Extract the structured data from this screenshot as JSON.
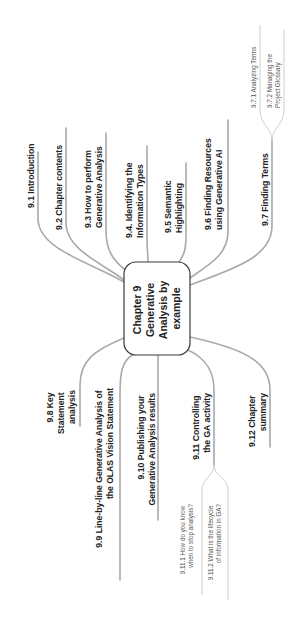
{
  "diagram": {
    "type": "mind-map",
    "orientation": "rotated-90-ccw",
    "central_topic": {
      "lines": [
        "Chapter 9",
        "Generative",
        "Analysis by",
        "example"
      ]
    },
    "right_branches": [
      {
        "id": "9.1",
        "lines": [
          "9.1 Introduction"
        ]
      },
      {
        "id": "9.2",
        "lines": [
          "9.2 Chapter contents"
        ]
      },
      {
        "id": "9.3",
        "lines": [
          "9.3 How to perform",
          "Generative Analysis"
        ]
      },
      {
        "id": "9.4",
        "lines": [
          "9.4. Identifying the",
          "Information Types"
        ]
      },
      {
        "id": "9.5",
        "lines": [
          "9.5 Semantic",
          "Highlighting"
        ]
      },
      {
        "id": "9.6",
        "lines": [
          "9.6 Finding Resources",
          "using Generative AI"
        ]
      },
      {
        "id": "9.7",
        "lines": [
          "9.7 Finding Terms"
        ],
        "children": [
          {
            "id": "9.7.1",
            "lines": [
              "9.7.1 Analyzing Terms"
            ]
          },
          {
            "id": "9.7.2",
            "lines": [
              "9.7.2 Managing the",
              "Project Glossary"
            ]
          }
        ]
      }
    ],
    "left_branches": [
      {
        "id": "9.8",
        "lines": [
          "9.8 Key",
          "Statement",
          "analysis"
        ]
      },
      {
        "id": "9.9",
        "lines": [
          "9.9 Line-by-line Generative Analysis of",
          "the OLAS Vision Statement"
        ]
      },
      {
        "id": "9.10",
        "lines": [
          "9.10 Publishing your",
          "Generative Analysis results"
        ]
      },
      {
        "id": "9.11",
        "lines": [
          "9.11 Controlling",
          "the GA activity"
        ],
        "children": [
          {
            "id": "9.11.1",
            "lines": [
              "9.11.1 How do you know",
              "when to stop analysis?"
            ]
          },
          {
            "id": "9.11.2",
            "lines": [
              "9.11.2 What is the lifecycle",
              "of information in GA?"
            ]
          }
        ]
      },
      {
        "id": "9.12",
        "lines": [
          "9.12 Chapter",
          "summary"
        ]
      }
    ],
    "colors": {
      "branch_line": "#a9a9a9",
      "sub_line": "#c8c8c8",
      "central_border": "#3a3a3a",
      "text": "#222222",
      "sub_text": "#555555",
      "background": "#ffffff"
    }
  }
}
